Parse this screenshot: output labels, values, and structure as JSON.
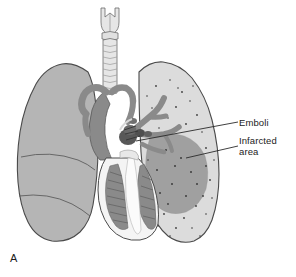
{
  "figure": {
    "panel_letter": "A",
    "kind": "medical-illustration"
  },
  "labels": {
    "emboli": "Emboli",
    "infarcted_area": "Infarcted\narea"
  },
  "anatomy": {
    "larynx": "larynx",
    "trachea": "trachea",
    "left_lung": "left lung (viewer left, 3 lobes)",
    "right_lung": "right lung (viewer right, stippled)",
    "heart": "heart",
    "pulmonary_arteries": "pulmonary arteries",
    "emboli_clot": "emboli clot",
    "infarct_wedge": "infarcted wedge"
  },
  "colors": {
    "background": "#ffffff",
    "outline": "#4a4a4a",
    "lung_left_fill": "#b5b5b5",
    "lung_right_fill": "#dcdcdc",
    "infarct_fill": "#9a9a9a",
    "vessel_dark": "#8a8a8a",
    "vessel_darker": "#6e6e6e",
    "trachea_fill": "#e6e6e6",
    "heart_white": "#f4f4f4",
    "stipple": "#3c3c3c",
    "leader_line": "#2a2a2a",
    "text": "#1c1c1c"
  },
  "leaders": [
    {
      "name": "emboli-leader",
      "from": [
        238,
        122
      ],
      "to": [
        136,
        141
      ]
    },
    {
      "name": "infarct-leader",
      "from": [
        238,
        146
      ],
      "to": [
        186,
        158
      ]
    }
  ]
}
